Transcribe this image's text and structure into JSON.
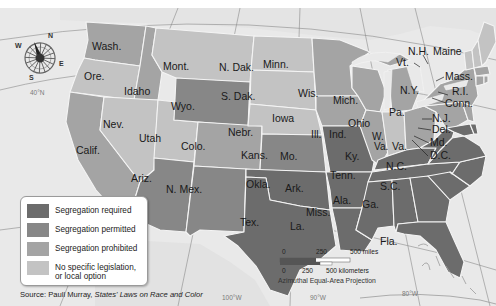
{
  "map": {
    "projection": "Azimuthal Equal-Area Projection",
    "compass": {
      "n": "N",
      "s": "S",
      "e": "E",
      "w": "W"
    },
    "coordinates": {
      "lat_40": "40°N",
      "lon_100": "100°W",
      "lon_90": "90°W",
      "lon_80": "80°W"
    },
    "colors": {
      "required": "#6c6c6c",
      "permitted": "#878787",
      "prohibited": "#a4a4a4",
      "none": "#c3c3c3",
      "water": "#e9e9e9",
      "land_outside": "#dedede"
    },
    "states": [
      {
        "name": "Wash.",
        "category": "prohibited"
      },
      {
        "name": "Ore.",
        "category": "none"
      },
      {
        "name": "Calif.",
        "category": "prohibited"
      },
      {
        "name": "Idaho",
        "category": "prohibited"
      },
      {
        "name": "Nev.",
        "category": "none"
      },
      {
        "name": "Utah",
        "category": "none"
      },
      {
        "name": "Ariz.",
        "category": "permitted"
      },
      {
        "name": "Mont.",
        "category": "none"
      },
      {
        "name": "Wyo.",
        "category": "permitted"
      },
      {
        "name": "Colo.",
        "category": "prohibited"
      },
      {
        "name": "N. Mex.",
        "category": "permitted"
      },
      {
        "name": "N. Dak.",
        "category": "none"
      },
      {
        "name": "S. Dak.",
        "category": "none"
      },
      {
        "name": "Nebr.",
        "category": "none"
      },
      {
        "name": "Kans.",
        "category": "permitted"
      },
      {
        "name": "Okla.",
        "category": "required"
      },
      {
        "name": "Tex.",
        "category": "required"
      },
      {
        "name": "Minn.",
        "category": "prohibited"
      },
      {
        "name": "Iowa",
        "category": "prohibited"
      },
      {
        "name": "Mo.",
        "category": "required"
      },
      {
        "name": "Ark.",
        "category": "required"
      },
      {
        "name": "La.",
        "category": "required"
      },
      {
        "name": "Wis.",
        "category": "prohibited"
      },
      {
        "name": "Ill.",
        "category": "prohibited"
      },
      {
        "name": "Mich.",
        "category": "prohibited"
      },
      {
        "name": "Ind.",
        "category": "none"
      },
      {
        "name": "Ohio",
        "category": "prohibited"
      },
      {
        "name": "Ky.",
        "category": "required"
      },
      {
        "name": "Tenn.",
        "category": "required"
      },
      {
        "name": "Miss.",
        "category": "required"
      },
      {
        "name": "Ala.",
        "category": "required"
      },
      {
        "name": "Ga.",
        "category": "required"
      },
      {
        "name": "Fla.",
        "category": "required"
      },
      {
        "name": "S.C.",
        "category": "required"
      },
      {
        "name": "N.C.",
        "category": "required"
      },
      {
        "name": "Va.",
        "category": "required"
      },
      {
        "name": "W. Va.",
        "category": "required"
      },
      {
        "name": "Pa.",
        "category": "prohibited"
      },
      {
        "name": "N.Y.",
        "category": "prohibited"
      },
      {
        "name": "N.J.",
        "category": "prohibited"
      },
      {
        "name": "Del.",
        "category": "required"
      },
      {
        "name": "Md.",
        "category": "required"
      },
      {
        "name": "D.C.",
        "category": "required"
      },
      {
        "name": "Conn.",
        "category": "prohibited"
      },
      {
        "name": "R.I.",
        "category": "prohibited"
      },
      {
        "name": "Mass.",
        "category": "prohibited"
      },
      {
        "name": "Vt.",
        "category": "none"
      },
      {
        "name": "N.H.",
        "category": "none"
      },
      {
        "name": "Maine",
        "category": "none"
      }
    ]
  },
  "legend": {
    "items": [
      {
        "label": "Segregation required",
        "color": "#6c6c6c"
      },
      {
        "label": "Segregation permitted",
        "color": "#878787"
      },
      {
        "label": "Segregation prohibited",
        "color": "#a4a4a4"
      },
      {
        "label": "No specific legislation, or local option",
        "line1": "No specific legislation,",
        "line2": "or local option",
        "color": "#c3c3c3"
      }
    ]
  },
  "scale": {
    "miles_0": "0",
    "miles_250": "250",
    "miles_500": "500 miles",
    "km_0": "0",
    "km_250": "250",
    "km_500": "500 kilometers"
  },
  "source": {
    "prefix": "Source: Paull Murray, ",
    "title": "States' Laws on Race and Color"
  }
}
